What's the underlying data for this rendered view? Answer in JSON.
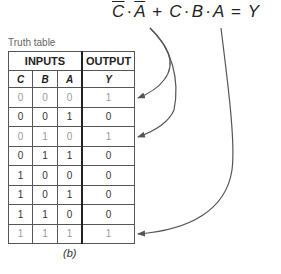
{
  "equation": {
    "term1": {
      "C": "C",
      "dot": "·",
      "A": "A",
      "negated": true
    },
    "plus": "+",
    "term2": {
      "C": "C",
      "dot1": "·",
      "B": "B",
      "dot2": "·",
      "A": "A"
    },
    "equals": "=",
    "output": "Y"
  },
  "table": {
    "caption": "Truth table",
    "group_headers": {
      "inputs": "INPUTS",
      "output": "OUTPUT"
    },
    "columns": [
      "C",
      "B",
      "A",
      "Y"
    ],
    "rows": [
      {
        "C": "0",
        "B": "0",
        "A": "0",
        "Y": "1",
        "highlighted": true
      },
      {
        "C": "0",
        "B": "0",
        "A": "1",
        "Y": "0",
        "highlighted": false
      },
      {
        "C": "0",
        "B": "1",
        "A": "0",
        "Y": "1",
        "highlighted": true
      },
      {
        "C": "0",
        "B": "1",
        "A": "1",
        "Y": "0",
        "highlighted": false
      },
      {
        "C": "1",
        "B": "0",
        "A": "0",
        "Y": "0",
        "highlighted": false
      },
      {
        "C": "1",
        "B": "0",
        "A": "1",
        "Y": "0",
        "highlighted": false
      },
      {
        "C": "1",
        "B": "1",
        "A": "0",
        "Y": "0",
        "highlighted": false
      },
      {
        "C": "1",
        "B": "1",
        "A": "1",
        "Y": "1",
        "highlighted": true
      }
    ]
  },
  "figure_label": "(b)",
  "colors": {
    "arrow": "#555555",
    "highlight_text": "#9a9a9a",
    "border": "#555555"
  }
}
